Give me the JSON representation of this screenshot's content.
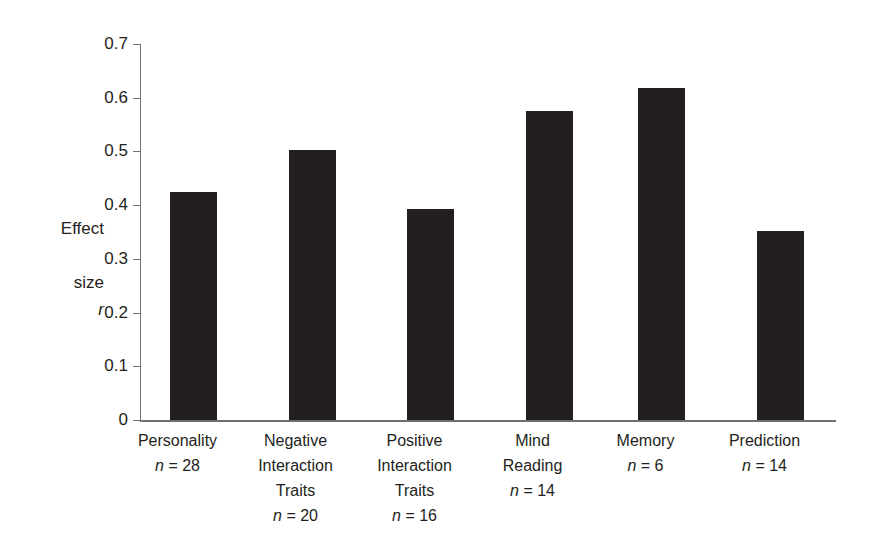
{
  "chart_data": {
    "type": "bar",
    "title": "",
    "subtitle": "",
    "xlabel": "",
    "ylabel": "Effect\nsize\nr",
    "ylabel_lines": [
      "Effect",
      "size",
      "r"
    ],
    "ylim": [
      0,
      0.7
    ],
    "yticks": [
      "0.7",
      "0.6",
      "0.5",
      "0.4",
      "0.3",
      "0.2",
      "0.1",
      "0"
    ],
    "ytick_values": [
      0.7,
      0.6,
      0.5,
      0.4,
      0.3,
      0.2,
      0.1,
      0
    ],
    "grid": false,
    "legend": false,
    "bar_color": "#231f20",
    "axis_color": "#6f6f6f",
    "categories": [
      "Personality",
      "Negative\nInteraction\nTraits",
      "Positive\nInteraction\nTraits",
      "Mind\nReading",
      "Memory",
      "Prediction"
    ],
    "values": [
      0.425,
      0.502,
      0.393,
      0.575,
      0.618,
      0.352
    ],
    "sample_sizes": [
      28,
      20,
      16,
      14,
      6,
      14
    ],
    "annotations": [
      {
        "label": "n = 28",
        "n_symbol": "n",
        "n_value": "= 28"
      },
      {
        "label": "n = 20",
        "n_symbol": "n",
        "n_value": "= 20"
      },
      {
        "label": "n = 16",
        "n_symbol": "n",
        "n_value": "= 16"
      },
      {
        "label": "n = 14",
        "n_symbol": "n",
        "n_value": "= 14"
      },
      {
        "label": "n = 6",
        "n_symbol": "n",
        "n_value": "= 6"
      },
      {
        "label": "n = 14",
        "n_symbol": "n",
        "n_value": "= 14"
      }
    ]
  }
}
